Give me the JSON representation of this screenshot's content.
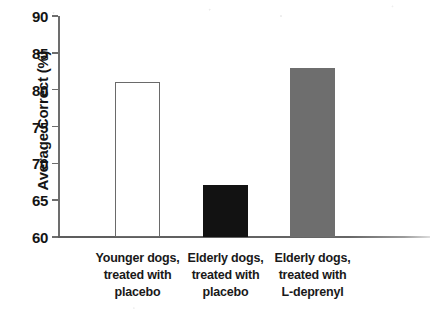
{
  "chart_data": {
    "type": "bar",
    "title": "",
    "subtitle": "",
    "xlabel": "",
    "ylabel": "Average Correct (%)",
    "categories": [
      "Younger dogs, treated with placebo",
      "Elderly dogs, treated with placebo",
      "Elderly dogs, treated with L-deprenyl"
    ],
    "category_lines": [
      [
        "Younger dogs,",
        "treated with",
        "placebo"
      ],
      [
        "Elderly dogs,",
        "treated with",
        "placebo"
      ],
      [
        "Elderly dogs,",
        "treated with",
        "L-deprenyl"
      ]
    ],
    "values": [
      81,
      67,
      83
    ],
    "ylim": [
      60,
      90
    ],
    "yticks": [
      60,
      65,
      70,
      75,
      80,
      85,
      90
    ],
    "ytick_labels": [
      "60",
      "65",
      "70",
      "75",
      "80",
      "85",
      "90"
    ],
    "grid": false,
    "legend": "none",
    "bar_styles": [
      "open-white",
      "solid-black",
      "solid-gray"
    ],
    "bar_colors": [
      "#ffffff",
      "#121212",
      "#6e6e6e"
    ],
    "bar_edge_colors": [
      "#6a6a6a",
      "#121212",
      "#6e6e6e"
    ]
  },
  "colors": {
    "background": "#ffffff",
    "axis": "#6d6d6d",
    "text": "#141414",
    "bar_open_fill": "#ffffff",
    "bar_open_edge": "#6a6a6a",
    "bar_black": "#121212",
    "bar_gray": "#6e6e6e"
  }
}
